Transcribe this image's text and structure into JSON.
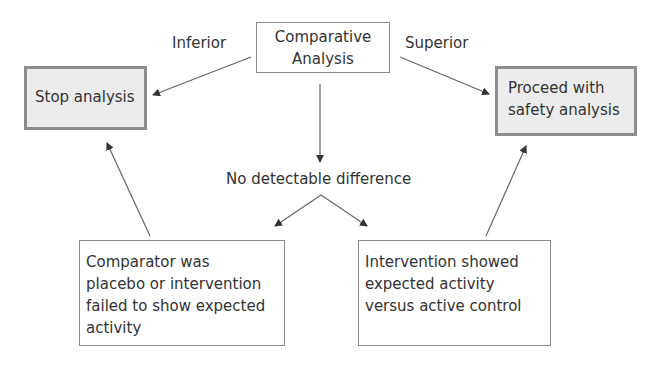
{
  "diagram": {
    "root": {
      "lines": [
        "Comparative",
        "Analysis"
      ]
    },
    "edge_labels": {
      "inferior": "Inferior",
      "superior": "Superior"
    },
    "stop": {
      "lines": [
        "Stop analysis"
      ]
    },
    "proceed": {
      "lines": [
        "Proceed with",
        "safety analysis"
      ]
    },
    "middle_label": "No detectable difference",
    "left_outcome": {
      "lines": [
        "Comparator was",
        "placebo or intervention",
        "failed to show expected",
        "activity"
      ]
    },
    "right_outcome": {
      "lines": [
        "Intervention showed",
        "expected activity",
        "versus active control"
      ]
    },
    "colors": {
      "shaded_fill": "#ececec",
      "shaded_border": "#8c8c8c",
      "line": "#555555",
      "text": "#333333"
    }
  }
}
